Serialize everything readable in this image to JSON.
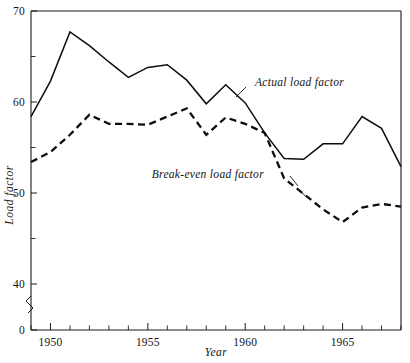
{
  "chart_data": {
    "type": "line",
    "title": "",
    "xlabel": "Year",
    "ylabel": "Load factor",
    "xlim": [
      1949,
      1968
    ],
    "ylim": [
      40,
      70
    ],
    "y_axis_break": true,
    "y_axis_break_note": "axis broken between 0 and 40",
    "grid": false,
    "legend_position": "inline-annotations",
    "x_tick_labels": [
      "1950",
      "1955",
      "1960",
      "1965"
    ],
    "x_tick_label_values": [
      1950,
      1955,
      1960,
      1965
    ],
    "x_minor_ticks": [
      1949,
      1951,
      1952,
      1953,
      1954,
      1956,
      1957,
      1958,
      1959,
      1961,
      1962,
      1963,
      1964,
      1966,
      1967,
      1968
    ],
    "y_tick_labels": [
      "0",
      "40",
      "50",
      "60",
      "70"
    ],
    "y_tick_label_values": [
      0,
      40,
      50,
      60,
      70
    ],
    "y_minor_ticks": [
      45,
      55,
      65
    ],
    "x": [
      1949,
      1950,
      1951,
      1952,
      1953,
      1954,
      1955,
      1956,
      1957,
      1958,
      1959,
      1960,
      1961,
      1962,
      1963,
      1964,
      1965,
      1966,
      1967,
      1968
    ],
    "series": [
      {
        "name": "Actual load factor",
        "style": "solid",
        "values": [
          58.4,
          62.3,
          67.7,
          66.2,
          64.4,
          62.7,
          63.8,
          64.1,
          62.4,
          59.8,
          61.9,
          59.9,
          56.6,
          53.8,
          53.7,
          55.4,
          55.4,
          58.4,
          57.1,
          52.9
        ]
      },
      {
        "name": "Break-even load factor",
        "style": "dashed",
        "values": [
          53.4,
          54.5,
          56.4,
          58.6,
          57.6,
          57.6,
          57.5,
          58.4,
          59.3,
          56.4,
          58.3,
          57.6,
          56.6,
          51.6,
          49.9,
          48.2,
          46.8,
          48.4,
          48.8,
          48.5
        ]
      }
    ],
    "annotations": [
      {
        "text": "Actual load factor",
        "x": 1960.5,
        "y": 61.8
      },
      {
        "text": "Break-even load factor",
        "x": 1955.2,
        "y": 51.6
      }
    ]
  }
}
